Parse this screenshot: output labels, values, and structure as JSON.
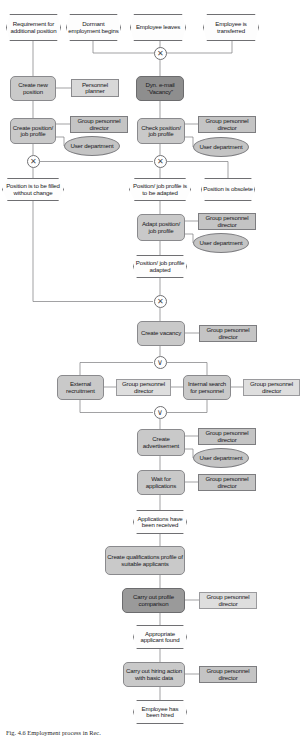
{
  "diagram": {
    "type": "event-driven-process-chain",
    "colors": {
      "event_fill": "#fdfdfd",
      "function_fill": "#c9c9c9",
      "function_fill_dark": "#8e8e8e",
      "org_fill": "#c4c4c4",
      "org_fill_light": "#d8d8d8",
      "line": "#6f6f72"
    },
    "caption": "Fig. 4.6   Employment process in Rec.",
    "events": {
      "requirement_additional_position": "Requirement for additional position",
      "dormant_employment_begins": "Dormant employment begins",
      "employee_leaves": "Employee leaves",
      "employee_transferred": "Employee is transferred",
      "position_filled_without_change": "Position is to be filled without change",
      "position_job_profile_adapted_event": "Position/ job profile is to be adapted",
      "position_obsolete": "Position is obsolete",
      "position_job_profile_adapted": "Position/ job profile adapted",
      "applications_received": "Applications have been received",
      "appropriate_applicant_found": "Appropriate applicant found",
      "employee_hired": "Employee has been hired"
    },
    "functions": {
      "create_new_position": "Create new position",
      "dyn_email_vacancy": "Dyn. e-mail “Vacancy”",
      "create_position_job_profile": "Create position/ job profile",
      "check_position_job_profile": "Check position/ job profile",
      "adapt_position_job_profile": "Adapt position/ job profile",
      "create_vacancy": "Create vacancy",
      "external_recruitment": "External recruitment",
      "internal_search_for_personnel": "Internal search for personnel",
      "create_advertisement": "Create advertisement",
      "wait_for_applications": "Wait for applications",
      "create_qualifications_profile": "Create qualifications profile of suitable applicants",
      "carry_out_profile_comparison": "Carry out profile comparison",
      "carry_out_hiring_action": "Carry out hiring action with basic data"
    },
    "org_units": {
      "personnel_planner": "Personnel planner",
      "group_personnel_director": "Group personnel director",
      "user_department": "User department"
    },
    "connectors": {
      "xor": "✕",
      "or": "∨"
    }
  }
}
